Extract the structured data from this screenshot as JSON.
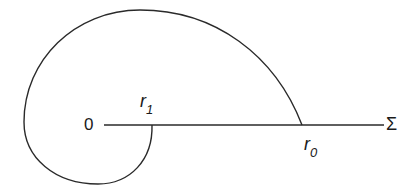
{
  "diagram": {
    "labels": {
      "origin": "0",
      "axis_end": "Σ",
      "r1_base": "r",
      "r1_sub": "1",
      "r0_base": "r",
      "r0_sub": "0"
    },
    "colors": {
      "stroke": "#2a2a2a",
      "background": "#ffffff"
    },
    "axis": {
      "x_start": 104,
      "x_end": 384,
      "y": 125
    },
    "points": {
      "r1": {
        "x": 152,
        "y": 125
      },
      "r0": {
        "x": 302,
        "y": 125
      }
    }
  }
}
